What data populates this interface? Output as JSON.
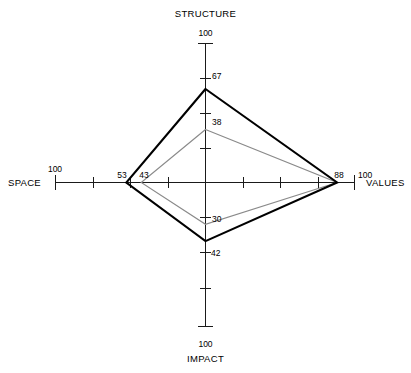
{
  "chart_data": {
    "type": "radar",
    "title": "",
    "axes": [
      "STRUCTURE",
      "VALUES",
      "IMPACT",
      "SPACE"
    ],
    "axis_max_label": "100",
    "range": [
      0,
      100
    ],
    "tick_interval": 25,
    "grid": false,
    "legend": "none",
    "series": [
      {
        "name": "outer",
        "color": "#000000",
        "values": [
          67,
          88,
          42,
          53
        ],
        "labels": [
          "67",
          "88",
          "42",
          "53"
        ]
      },
      {
        "name": "inner",
        "color": "#8a8a8a",
        "values": [
          38,
          88,
          30,
          43
        ],
        "labels": [
          "38",
          "88",
          "30",
          "43"
        ]
      }
    ]
  },
  "axes": {
    "structure": {
      "title": "STRUCTURE",
      "max": "100",
      "outer_value": "67",
      "inner_value": "38"
    },
    "values": {
      "title": "VALUES",
      "max": "100",
      "outer_value": "88",
      "inner_value": "88"
    },
    "impact": {
      "title": "IMPACT",
      "max": "100",
      "outer_value": "42",
      "inner_value": "30"
    },
    "space": {
      "title": "SPACE",
      "max": "100",
      "outer_value": "53",
      "inner_value": "43"
    }
  }
}
